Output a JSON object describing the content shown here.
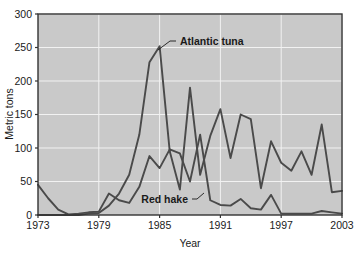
{
  "chart_data": {
    "type": "line",
    "title": "",
    "xlabel": "Year",
    "ylabel": "Metric tons",
    "xlim": [
      1973,
      2003
    ],
    "ylim": [
      0,
      300
    ],
    "xticks": [
      1973,
      1979,
      1985,
      1991,
      1997,
      2003
    ],
    "yticks": [
      0,
      50,
      100,
      150,
      200,
      250,
      300
    ],
    "grid": true,
    "legend_position": "inline-annotations",
    "plot_background": "#c9c9c9",
    "grid_color": "#f2f2f2",
    "line_color": "#4a4a4a",
    "x": [
      1973,
      1974,
      1975,
      1976,
      1977,
      1978,
      1979,
      1980,
      1981,
      1982,
      1983,
      1984,
      1985,
      1986,
      1987,
      1988,
      1989,
      1990,
      1991,
      1992,
      1993,
      1994,
      1995,
      1996,
      1997,
      1998,
      1999,
      2000,
      2001,
      2002,
      2003
    ],
    "series": [
      {
        "name": "Atlantic tuna",
        "label": "Atlantic tuna",
        "values": [
          0,
          0,
          0,
          0,
          0,
          2,
          3,
          14,
          32,
          60,
          120,
          228,
          252,
          95,
          38,
          190,
          60,
          118,
          158,
          85,
          150,
          143,
          40,
          110,
          78,
          66,
          95,
          60,
          135,
          34,
          36
        ]
      },
      {
        "name": "Red hake",
        "label": "Red hake",
        "values": [
          45,
          25,
          8,
          1,
          2,
          4,
          5,
          32,
          22,
          18,
          42,
          88,
          70,
          98,
          92,
          50,
          120,
          22,
          15,
          14,
          24,
          10,
          8,
          30,
          2,
          2,
          2,
          2,
          6,
          4,
          2
        ]
      }
    ],
    "annotations": [
      {
        "name": "Atlantic tuna",
        "text": "Atlantic tuna",
        "points_to_year": 1985
      },
      {
        "name": "Red hake",
        "text": "Red hake",
        "points_to_year": 1988
      }
    ]
  }
}
